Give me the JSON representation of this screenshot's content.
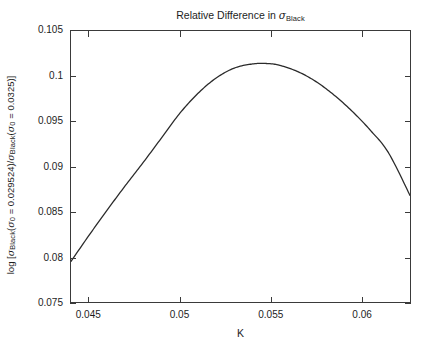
{
  "chart_data": {
    "type": "line",
    "title_parts": {
      "prefix": "Relative Difference in ",
      "symbol": "σ",
      "subscript": "Black"
    },
    "xlabel": "K",
    "ylabel": "log [σ_Black(σ_0 = 0.029524)/σ_Black(σ_0 = 0.0325)]",
    "ylabel_parts": {
      "open": "log [",
      "sym1": "σ",
      "sub1": "Black",
      "paren1": "(",
      "sym2": "σ",
      "sub2": "0",
      "eq1": " = 0.029524)/",
      "sym3": "σ",
      "sub3": "Black",
      "paren2": "(",
      "sym4": "σ",
      "sub4": "0",
      "eq2": " = 0.0325)]"
    },
    "xlim": [
      0.044,
      0.06268
    ],
    "ylim": [
      0.075,
      0.105
    ],
    "xticks": [
      0.045,
      0.05,
      0.055,
      0.06
    ],
    "xticklabels": [
      "0.045",
      "0.05",
      "0.055",
      "0.06"
    ],
    "yticks": [
      0.075,
      0.08,
      0.085,
      0.09,
      0.095,
      0.1,
      0.105
    ],
    "yticklabels": [
      "0.075",
      "0.08",
      "0.085",
      "0.09",
      "0.095",
      "0.1",
      "0.105"
    ],
    "grid": false,
    "legend": null,
    "line_color": "#2b2b2b",
    "line_width": 1.3,
    "series": [
      {
        "name": "relative-difference",
        "x": [
          0.044,
          0.045,
          0.046,
          0.047,
          0.048,
          0.049,
          0.05,
          0.051,
          0.052,
          0.053,
          0.054,
          0.0548,
          0.0555,
          0.0565,
          0.0575,
          0.0585,
          0.0595,
          0.0605,
          0.0615,
          0.06268
        ],
        "y": [
          0.0795,
          0.0824,
          0.0852,
          0.0879,
          0.0905,
          0.0932,
          0.0959,
          0.0981,
          0.0998,
          0.1009,
          0.10135,
          0.1014,
          0.1012,
          0.1005,
          0.0994,
          0.0979,
          0.0961,
          0.094,
          0.0915,
          0.0868
        ]
      }
    ]
  }
}
